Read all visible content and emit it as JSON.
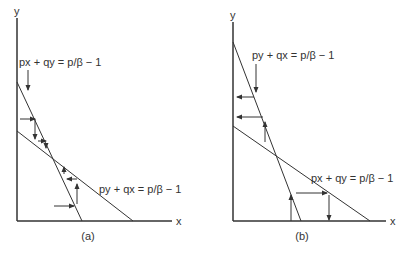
{
  "panels": [
    {
      "id": "a",
      "caption": "(a)",
      "x_axis_label": "x",
      "y_axis_label": "y",
      "steep_line_label": "px + qy = p/β − 1",
      "shallow_line_label": "py + qx = p/β − 1"
    },
    {
      "id": "b",
      "caption": "(b)",
      "x_axis_label": "x",
      "y_axis_label": "y",
      "steep_line_label": "py + qx = p/β − 1",
      "shallow_line_label": "px + qy = p/β − 1"
    }
  ],
  "colors": {
    "line": "#333333",
    "background": "#ffffff"
  }
}
